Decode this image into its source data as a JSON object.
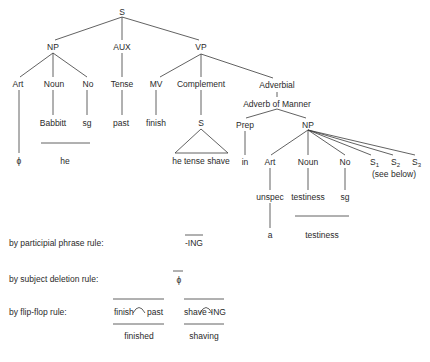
{
  "tree": {
    "root": "S",
    "level1": {
      "np": "NP",
      "aux": "AUX",
      "vp": "VP"
    },
    "level2": {
      "art": "Art",
      "noun": "Noun",
      "no": "No",
      "tense": "Tense",
      "mv": "MV",
      "complement": "Complement",
      "adverbial": "Adverbial"
    },
    "adverb_of_manner": "Adverb of Manner",
    "level3": {
      "babbitt": "Babbitt",
      "sg": "sg",
      "past": "past",
      "finish": "finish",
      "s": "S"
    },
    "adverbial_children": {
      "prep": "Prep",
      "np": "NP"
    },
    "level4": {
      "phi": "ϕ",
      "he": "he",
      "embedded": "he tense shave",
      "in": "in",
      "art": "Art",
      "noun": "Noun",
      "no": "No",
      "s_label": "S",
      "s1_sub": "1",
      "s2_sub": "2",
      "s3_sub": "3",
      "see_below": "(see below)"
    },
    "level5": {
      "unspec": "unspec",
      "testiness": "testiness",
      "sg": "sg"
    },
    "level6": {
      "a": "a",
      "testiness": "testiness"
    }
  },
  "rules": [
    {
      "label": "by participial phrase rule:",
      "result": "-ING"
    },
    {
      "label": "by subject deletion rule:",
      "result": "ϕ"
    },
    {
      "label": "by flip-flop rule:",
      "pairs": [
        {
          "left": "finish",
          "right": "past",
          "output": "finished"
        },
        {
          "left": "shave",
          "right": "-ING",
          "output": "shaving"
        }
      ]
    }
  ]
}
